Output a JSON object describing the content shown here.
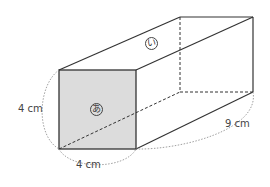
{
  "figure": {
    "type": "rectangular-prism",
    "front_face_label": "あ",
    "top_face_label": "い",
    "dimensions": {
      "height_label": "4 cm",
      "width_label": "4 cm",
      "length_label": "9 cm"
    },
    "colors": {
      "front_face_fill": "#dcdcdc",
      "edge": "#333333",
      "guide": "#888888"
    }
  }
}
